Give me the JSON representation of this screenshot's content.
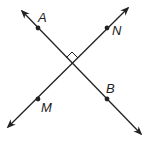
{
  "diagram": {
    "lines": [
      {
        "name": "line-AB",
        "points": [
          "A",
          "B"
        ]
      },
      {
        "name": "line-MN",
        "points": [
          "M",
          "N"
        ]
      }
    ],
    "points": [
      {
        "label": "A",
        "x": 38,
        "y": 28
      },
      {
        "label": "N",
        "x": 107,
        "y": 28
      },
      {
        "label": "M",
        "x": 38,
        "y": 99
      },
      {
        "label": "B",
        "x": 107,
        "y": 99
      }
    ],
    "right_angle_marker": true,
    "line_color": "#222222"
  }
}
